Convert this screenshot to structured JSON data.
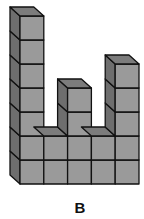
{
  "figure": {
    "label": "B",
    "column_heights": [
      7,
      2,
      4,
      2,
      5
    ],
    "colors": {
      "front": "#9a9a9a",
      "side": "#6e6e6e",
      "top": "#7c7c7c",
      "edge": "#111111"
    }
  }
}
